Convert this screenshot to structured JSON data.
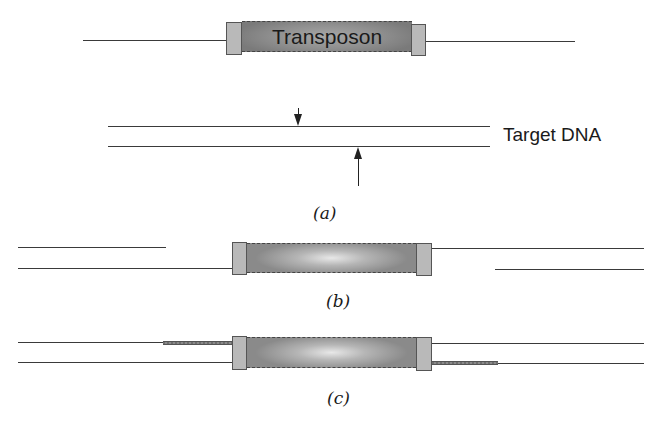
{
  "diagram": {
    "panel_a": {
      "transposon_label": "Transposon",
      "target_label": "Target DNA",
      "caption": "(a)"
    },
    "panel_b": {
      "caption": "(b)"
    },
    "panel_c": {
      "caption": "(c)"
    },
    "colors": {
      "strand": "#3a3a3a",
      "cap": "#b9b9b9",
      "body": "#8e8e8e",
      "filled_gap": "#777777"
    }
  }
}
